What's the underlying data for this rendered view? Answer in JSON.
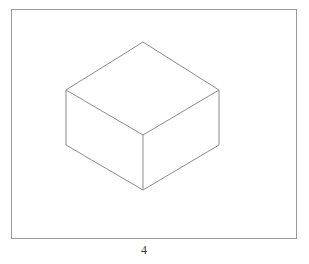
{
  "page": {
    "background_color": "#ffffff",
    "width": 309,
    "height": 264
  },
  "frame": {
    "stroke_color": "#9a9a9a",
    "fill_color": "#ffffff",
    "x": 11,
    "y": 9,
    "width": 286,
    "height": 230
  },
  "caption": {
    "text": "4"
  },
  "figure": {
    "name": "isometric-cuboid",
    "stroke_color": "#8b8b8b",
    "fill_color": "#ffffff",
    "stroke_width": 1,
    "vertices": {
      "top_apex": [
        143,
        42
      ],
      "top_left": [
        66,
        90
      ],
      "top_right": [
        219,
        90
      ],
      "top_front": [
        143,
        135
      ],
      "bottom_left": [
        66,
        145
      ],
      "bottom_right": [
        219,
        145
      ],
      "bottom_front": [
        143,
        190
      ]
    },
    "faces": {
      "top": "143,42 219,90 143,135 66,90",
      "left": "66,90 143,135 143,190 66,145",
      "right": "143,135 219,90 219,145 143,190"
    },
    "edges": [
      "66,90 143,42 219,90",
      "66,90 143,135 219,90",
      "143,135 143,190",
      "66,90 66,145 143,190 219,145 219,90"
    ]
  }
}
